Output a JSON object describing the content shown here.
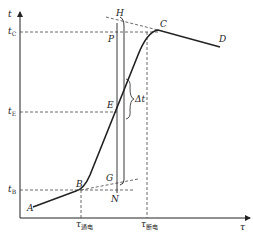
{
  "diagram": {
    "type": "temperature-time curve",
    "axes": {
      "y_label": "t",
      "x_label": "τ"
    },
    "y_ticks": {
      "tC": {
        "main": "t",
        "sub": "C"
      },
      "tE": {
        "main": "t",
        "sub": "E"
      },
      "tB": {
        "main": "t",
        "sub": "B"
      }
    },
    "x_ticks": {
      "on": {
        "main": "τ",
        "sub": "通电"
      },
      "off": {
        "main": "τ",
        "sub": "断电"
      }
    },
    "points": {
      "A": "A",
      "B": "B",
      "C": "C",
      "D": "D",
      "E": "E",
      "G": "G",
      "H": "H",
      "N": "N",
      "P": "P"
    },
    "delta": "Δt",
    "colors": {
      "line": "#222222",
      "dashed": "#444444"
    }
  }
}
